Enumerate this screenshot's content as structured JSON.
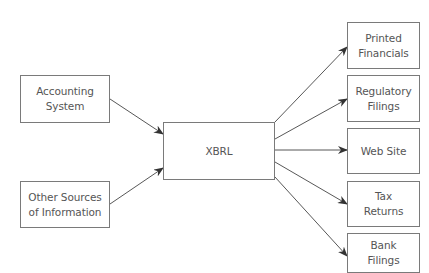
{
  "diagram": {
    "type": "flow",
    "colors": {
      "background": "#ffffff",
      "box_border": "#7a7a7a",
      "text": "#555555",
      "arrow": "#444444"
    },
    "nodes": {
      "accounting": {
        "label": "Accounting\nSystem",
        "x": 20,
        "y": 75,
        "w": 90,
        "h": 48
      },
      "other": {
        "label": "Other Sources\nof Information",
        "x": 20,
        "y": 181,
        "w": 90,
        "h": 47
      },
      "xbrl": {
        "label": "XBRL",
        "x": 163,
        "y": 122,
        "w": 112,
        "h": 58
      },
      "printed": {
        "label": "Printed\nFinancials",
        "x": 347,
        "y": 22,
        "w": 73,
        "h": 47
      },
      "regulatory": {
        "label": "Regulatory\nFilings",
        "x": 347,
        "y": 75,
        "w": 73,
        "h": 47
      },
      "website": {
        "label": "Web Site",
        "x": 347,
        "y": 128,
        "w": 73,
        "h": 46
      },
      "tax": {
        "label": "Tax\nReturns",
        "x": 347,
        "y": 181,
        "w": 73,
        "h": 46
      },
      "bank": {
        "label": "Bank\nFilings",
        "x": 347,
        "y": 233,
        "w": 73,
        "h": 40
      }
    },
    "edges": [
      {
        "from": "accounting",
        "to": "xbrl",
        "x1": 110,
        "y1": 99,
        "x2": 163,
        "y2": 134
      },
      {
        "from": "other",
        "to": "xbrl",
        "x1": 110,
        "y1": 204,
        "x2": 163,
        "y2": 168
      },
      {
        "from": "xbrl",
        "to": "printed",
        "x1": 275,
        "y1": 122,
        "x2": 347,
        "y2": 47
      },
      {
        "from": "xbrl",
        "to": "regulatory",
        "x1": 275,
        "y1": 139,
        "x2": 347,
        "y2": 99
      },
      {
        "from": "xbrl",
        "to": "website",
        "x1": 275,
        "y1": 150,
        "x2": 347,
        "y2": 150
      },
      {
        "from": "xbrl",
        "to": "tax",
        "x1": 275,
        "y1": 162,
        "x2": 347,
        "y2": 204
      },
      {
        "from": "xbrl",
        "to": "bank",
        "x1": 275,
        "y1": 177,
        "x2": 347,
        "y2": 256
      }
    ]
  }
}
